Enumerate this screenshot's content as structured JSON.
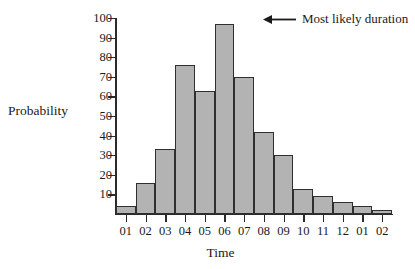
{
  "chart_data": {
    "type": "bar",
    "title": "",
    "xlabel": "Time",
    "ylabel": "Probability",
    "categories": [
      "01",
      "02",
      "03",
      "04",
      "05",
      "06",
      "07",
      "08",
      "09",
      "10",
      "11",
      "12",
      "01",
      "02"
    ],
    "values": [
      4,
      16,
      33,
      76,
      63,
      97,
      70,
      42,
      30,
      13,
      9,
      6,
      4,
      2
    ],
    "ylim": [
      0,
      100
    ],
    "yticks": [
      10,
      20,
      30,
      40,
      50,
      60,
      70,
      80,
      90,
      100
    ],
    "ytick_labels": [
      "10",
      "20",
      "30",
      "40",
      "50",
      "60",
      "70",
      "80",
      "90",
      "100"
    ],
    "grid": false,
    "legend": "none",
    "annotations": [
      {
        "text": "Most likely duration",
        "icon": "left-arrow-icon",
        "points_to_category": "06",
        "points_to_value": 97
      }
    ],
    "bar_fill_color": "#b3b3b3",
    "bar_edge_color": "#2f2f2f",
    "axis_color": "#2b2b2b",
    "background_color": "#ffffff"
  }
}
